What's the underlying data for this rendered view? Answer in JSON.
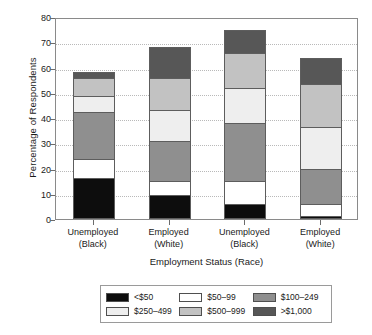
{
  "chart_data": {
    "type": "bar",
    "subtype": "stacked-bar",
    "title": "",
    "xlabel": "Employment Status (Race)",
    "ylabel": "Percentage of Respondents",
    "ylim": [
      0,
      80
    ],
    "yticks": [
      0,
      10,
      20,
      30,
      40,
      50,
      60,
      70,
      80
    ],
    "grid": true,
    "legend_position": "bottom",
    "categories": [
      "Unemployed (Black)",
      "Employed (White)",
      "Unemployed (Black)",
      "Employed (White)"
    ],
    "category_lines": [
      [
        "Unemployed",
        "(Black)"
      ],
      [
        "Employed",
        "(White)"
      ],
      [
        "Unemployed",
        "(Black)"
      ],
      [
        "Employed",
        "(White)"
      ]
    ],
    "series": [
      {
        "name": "<$50",
        "color": "#0d0d0d",
        "values": [
          16.3,
          9.5,
          6.0,
          1.0
        ]
      },
      {
        "name": "$50–99",
        "color": "#ffffff",
        "values": [
          8.0,
          6.0,
          9.5,
          5.5
        ]
      },
      {
        "name": "$100–249",
        "color": "#8f8f8f",
        "values": [
          19.0,
          16.0,
          23.5,
          14.0
        ]
      },
      {
        "name": "$250–499",
        "color": "#eeeeee",
        "values": [
          6.5,
          13.0,
          14.0,
          17.0
        ]
      },
      {
        "name": "$500–999",
        "color": "#c2c2c2",
        "values": [
          7.5,
          13.0,
          14.5,
          17.5
        ]
      },
      {
        "name": ">$1,000",
        "color": "#575757",
        "values": [
          3.0,
          12.5,
          9.5,
          10.8
        ]
      }
    ],
    "totals": [
      60.3,
      70.0,
      77.0,
      65.8
    ]
  },
  "axes": {
    "ylabel": "Percentage of Respondents",
    "xlabel": "Employment Status (Race)",
    "ytick_labels": [
      "0",
      "10",
      "20",
      "30",
      "40",
      "50",
      "60",
      "70",
      "80"
    ]
  },
  "legend": {
    "items": [
      {
        "label": "<$50",
        "color": "#0d0d0d"
      },
      {
        "label": "$50–99",
        "color": "#ffffff"
      },
      {
        "label": "$100–249",
        "color": "#8f8f8f"
      },
      {
        "label": "$250–499",
        "color": "#eeeeee"
      },
      {
        "label": "$500–999",
        "color": "#c2c2c2"
      },
      {
        "label": ">$1,000",
        "color": "#575757"
      }
    ]
  }
}
